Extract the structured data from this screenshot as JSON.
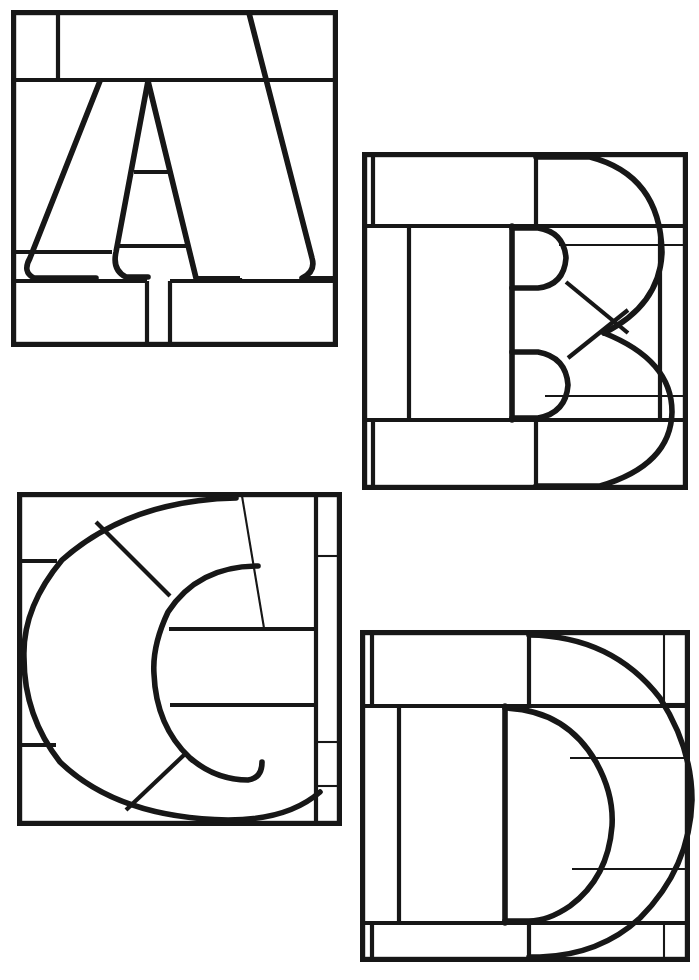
{
  "document": {
    "kind": "line-art-coloring-page",
    "title": "Stained Glass Alphabet Pattern A B C D",
    "description": "Four square stained-glass style panels, each containing a large serif block letter subdivided by lead lines into irregular glass pieces.",
    "page_width": 699,
    "page_height": 980,
    "background_color": "#ffffff",
    "line_color": "#171717",
    "panel_count": 4,
    "letters_shown": [
      "A",
      "B",
      "C",
      "D"
    ],
    "visible_text": []
  },
  "panels": [
    {
      "id": "panel-a",
      "letter": "A",
      "position": "top-left",
      "frame": {
        "x": 11,
        "y": 10,
        "width": 327,
        "height": 337
      },
      "glass_piece_count": 12,
      "lead_lines": [
        {
          "name": "top-left-vertical-divider",
          "type": "straight"
        },
        {
          "name": "upper-horizontal-band",
          "type": "straight"
        },
        {
          "name": "lower-horizontal-band",
          "type": "straight"
        },
        {
          "name": "foot-vertical-left",
          "type": "straight"
        },
        {
          "name": "foot-vertical-right",
          "type": "straight"
        },
        {
          "name": "crossbar-upper",
          "type": "straight"
        },
        {
          "name": "crossbar-lower",
          "type": "straight"
        },
        {
          "name": "left-counter-horizontal",
          "type": "straight"
        }
      ]
    },
    {
      "id": "panel-b",
      "letter": "B",
      "position": "top-right",
      "frame": {
        "x": 362,
        "y": 152,
        "width": 326,
        "height": 338
      },
      "glass_piece_count": 13,
      "lead_lines": [
        {
          "name": "left-narrow-stile",
          "type": "straight"
        },
        {
          "name": "top-horizontal-band",
          "type": "straight"
        },
        {
          "name": "bottom-horizontal-band",
          "type": "straight"
        },
        {
          "name": "stem-vertical",
          "type": "straight"
        },
        {
          "name": "upper-bowl-arc",
          "type": "curve"
        },
        {
          "name": "lower-bowl-arc",
          "type": "curve"
        },
        {
          "name": "upper-counter-arc",
          "type": "curve"
        },
        {
          "name": "lower-counter-arc",
          "type": "curve"
        },
        {
          "name": "diagonal-x-brace",
          "type": "straight"
        },
        {
          "name": "right-upper-horizontal",
          "type": "straight"
        },
        {
          "name": "right-lower-horizontal",
          "type": "straight"
        }
      ]
    },
    {
      "id": "panel-c",
      "letter": "C",
      "position": "bottom-left",
      "frame": {
        "x": 17,
        "y": 492,
        "width": 325,
        "height": 334
      },
      "glass_piece_count": 12,
      "lead_lines": [
        {
          "name": "outer-c-arc",
          "type": "curve"
        },
        {
          "name": "inner-c-arc",
          "type": "curve"
        },
        {
          "name": "upper-left-diagonal",
          "type": "straight"
        },
        {
          "name": "lower-left-diagonal",
          "type": "straight"
        },
        {
          "name": "left-upper-horizontal",
          "type": "straight"
        },
        {
          "name": "left-lower-horizontal",
          "type": "straight"
        },
        {
          "name": "mid-upper-horizontal",
          "type": "straight"
        },
        {
          "name": "mid-lower-horizontal",
          "type": "straight"
        },
        {
          "name": "right-vertical-stile",
          "type": "straight"
        },
        {
          "name": "right-stile-upper-break",
          "type": "straight"
        },
        {
          "name": "right-stile-lower-break",
          "type": "straight"
        }
      ]
    },
    {
      "id": "panel-d",
      "letter": "D",
      "position": "bottom-right",
      "frame": {
        "x": 360,
        "y": 630,
        "width": 330,
        "height": 332
      },
      "glass_piece_count": 12,
      "lead_lines": [
        {
          "name": "left-narrow-stile",
          "type": "straight"
        },
        {
          "name": "top-horizontal-band",
          "type": "straight"
        },
        {
          "name": "bottom-horizontal-band",
          "type": "straight"
        },
        {
          "name": "stem-vertical",
          "type": "straight"
        },
        {
          "name": "outer-d-bowl-arc",
          "type": "curve"
        },
        {
          "name": "inner-d-counter-arc",
          "type": "curve"
        },
        {
          "name": "right-upper-horizontal",
          "type": "straight"
        },
        {
          "name": "right-lower-horizontal",
          "type": "straight"
        },
        {
          "name": "right-corner-upper-break",
          "type": "straight"
        },
        {
          "name": "right-corner-lower-break",
          "type": "straight"
        }
      ]
    }
  ]
}
